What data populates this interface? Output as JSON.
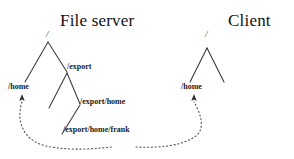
{
  "diagram": {
    "type": "nfs-mount-tree-diagram",
    "background_color": "#ffffff",
    "line_color": "#333333",
    "text_color": "#1a1a1a",
    "titles": {
      "server": "File server",
      "client": "Client"
    },
    "server_tree": {
      "root": "/",
      "nodes": [
        {
          "id": "home",
          "label": "/home"
        },
        {
          "id": "export",
          "label": "/export"
        },
        {
          "id": "export-home",
          "label": "/export/home"
        },
        {
          "id": "export-home-frank",
          "label": "/export/home/frank"
        }
      ]
    },
    "client_tree": {
      "root": "/",
      "nodes": [
        {
          "id": "home",
          "label": "/home"
        }
      ]
    },
    "connector": {
      "style": "dotted-curve",
      "arrowheads": "both-ends-up",
      "description": "dotted arc linking server /home mount point to client /home mount point"
    }
  }
}
